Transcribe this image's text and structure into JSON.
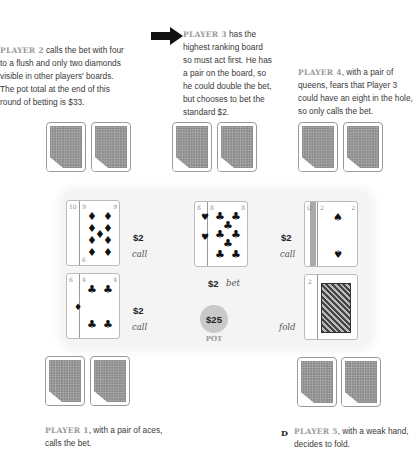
{
  "pot": {
    "amount": "$25",
    "label": "POT"
  },
  "players": [
    {
      "id": 1,
      "label": "PLAYER 1",
      "text": ", with a pair of aces, calls the bet.",
      "line1": ", with a pair of aces,",
      "line2": "calls the bet.",
      "hole_cards": [
        "A♠",
        "A♦"
      ],
      "board": [
        "6♦",
        "4♣"
      ],
      "board_desc": "Six of diamonds under four of clubs",
      "amount": "$2",
      "action": "call"
    },
    {
      "id": 2,
      "label": "PLAYER 2",
      "lines": [
        " calls the bet with four",
        "to a flush and only two diamonds",
        "visible in other players' boards.",
        "The pot total at the end of this",
        "round of betting is $33."
      ],
      "hole_cards": [
        "?",
        "?"
      ],
      "board": [
        "10♦",
        "9♦"
      ],
      "board_desc": "Ten of diamonds under nine of diamonds",
      "amount": "$2",
      "action": "call"
    },
    {
      "id": 3,
      "label": "PLAYER 3",
      "lines": [
        " has the",
        "highest ranking board",
        "so must act first. He has",
        "a pair on the board, so",
        "he could double the bet,",
        "but chooses to bet the",
        "standard $2."
      ],
      "hole_cards": [
        "?",
        "?"
      ],
      "board": [
        "8♥",
        "8♣"
      ],
      "board_desc": "Eight of hearts under eight of clubs",
      "amount": "$2",
      "action": "bet"
    },
    {
      "id": 4,
      "label": "PLAYER 4",
      "lines": [
        ", with a pair of",
        "queens, fears that Player 3",
        "could have an eight in the hole,",
        "so only calls the bet."
      ],
      "hole_cards": [
        "Q",
        "?"
      ],
      "board": [
        "Q♠",
        "2♠"
      ],
      "board_desc": "Queen of spades under two of spades",
      "amount": "$2",
      "action": "call"
    },
    {
      "id": 5,
      "label": "PLAYER 5",
      "line1": ", with a weak hand,",
      "line2": "decides to fold.",
      "hole_cards": [
        "5",
        "8"
      ],
      "board": [
        "2♣",
        "K♥"
      ],
      "board_desc": "Two of clubs under king of hearts",
      "amount": "",
      "action": "fold"
    }
  ],
  "badge": "D",
  "pip": {
    "diamond": "♦",
    "club": "♣",
    "heart": "♥",
    "spade": "♠"
  },
  "index": {
    "p2a": "10",
    "p2b": "9",
    "p2c": "6",
    "p1a": "6",
    "p1b": "4",
    "p3a": "8",
    "p3b": "8",
    "p4a": "Q",
    "p4b": "2",
    "p5a": "2",
    "p5b": "K"
  }
}
